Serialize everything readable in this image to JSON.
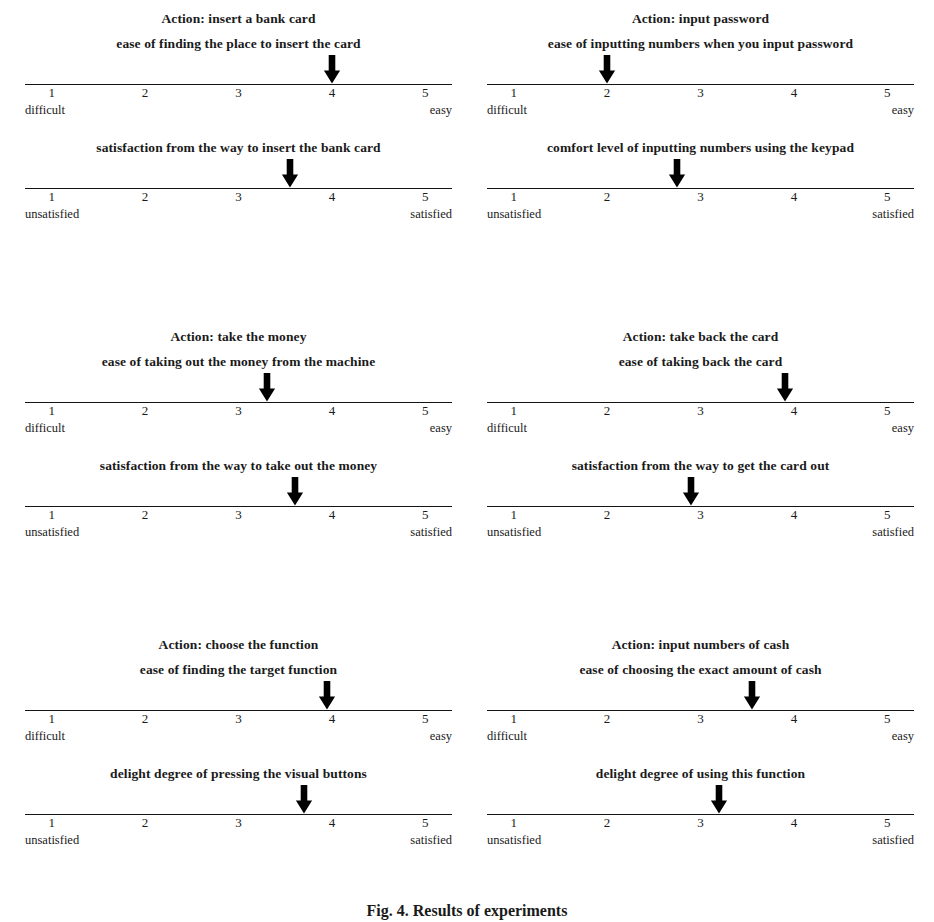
{
  "figure": {
    "caption": "Fig. 4. Results of experiments",
    "scale_min_label": "1",
    "scale_max_label": "5",
    "tick_labels": [
      "1",
      "2",
      "3",
      "4",
      "5"
    ],
    "ease_anchor_low": "difficult",
    "ease_anchor_high": "easy",
    "satisfaction_anchor_low": "unsatisfied",
    "satisfaction_anchor_high": "satisfied",
    "arrow_color": "#000000",
    "line_color": "#141414"
  },
  "chart_data": {
    "type": "bar",
    "title": "Fig. 4. Results of experiments",
    "xlabel": "rating scale (1-5)",
    "ylabel": "",
    "xlim": [
      1,
      5
    ],
    "grid": false,
    "legend": "none",
    "scale_ticks": [
      1,
      2,
      3,
      4,
      5
    ],
    "panels": [
      {
        "action": "Action: insert a bank card",
        "position": "top-left",
        "items": [
          {
            "label": "ease of finding the place to insert the card",
            "value": 4.0,
            "anchor_low": "difficult",
            "anchor_high": "easy"
          },
          {
            "label": "satisfaction from the way to insert the bank card",
            "value": 3.55,
            "anchor_low": "unsatisfied",
            "anchor_high": "satisfied"
          }
        ]
      },
      {
        "action": "Action: input password",
        "position": "top-right",
        "items": [
          {
            "label": "ease of inputting numbers when you input password",
            "value": 2.0,
            "anchor_low": "difficult",
            "anchor_high": "easy"
          },
          {
            "label": "comfort level of inputting numbers using the keypad",
            "value": 2.75,
            "anchor_low": "unsatisfied",
            "anchor_high": "satisfied"
          }
        ]
      },
      {
        "action": "Action: take the money",
        "position": "middle-left",
        "items": [
          {
            "label": "ease of taking out the money from the machine",
            "value": 3.3,
            "anchor_low": "difficult",
            "anchor_high": "easy"
          },
          {
            "label": "satisfaction from the way to take out the money",
            "value": 3.6,
            "anchor_low": "unsatisfied",
            "anchor_high": "satisfied"
          }
        ]
      },
      {
        "action": "Action: take back the card",
        "position": "middle-right",
        "items": [
          {
            "label": "ease of taking back the card",
            "value": 3.9,
            "anchor_low": "difficult",
            "anchor_high": "easy"
          },
          {
            "label": "satisfaction from the way to get the card out",
            "value": 2.9,
            "anchor_low": "unsatisfied",
            "anchor_high": "satisfied"
          }
        ]
      },
      {
        "action": "Action: choose the function",
        "position": "bottom-left",
        "items": [
          {
            "label": "ease of finding the target function",
            "value": 3.95,
            "anchor_low": "difficult",
            "anchor_high": "easy"
          },
          {
            "label": "delight degree of pressing the visual buttons",
            "value": 3.7,
            "anchor_low": "unsatisfied",
            "anchor_high": "satisfied"
          }
        ]
      },
      {
        "action": "Action: input numbers of cash",
        "position": "bottom-right",
        "items": [
          {
            "label": "ease of choosing the exact amount of cash",
            "value": 3.55,
            "anchor_low": "difficult",
            "anchor_high": "easy"
          },
          {
            "label": "delight degree of using this function",
            "value": 3.2,
            "anchor_low": "unsatisfied",
            "anchor_high": "satisfied"
          }
        ]
      }
    ]
  }
}
